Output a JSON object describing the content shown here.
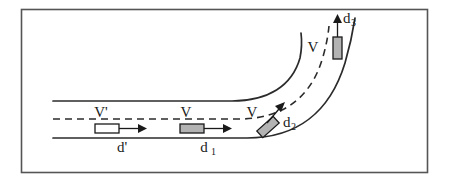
{
  "figure": {
    "frame": {
      "name": "figure-border",
      "color": "#555555",
      "x": 21,
      "y": 9,
      "width": 407,
      "height": 164
    },
    "colors": {
      "line": "#2b2b2b",
      "vehicle_fill_gray": "#b3b3b3",
      "vehicle_fill_white": "#ffffff",
      "vehicle_stroke": "#1a1a1a",
      "frame": "#555555",
      "background": "#ffffff"
    },
    "road": {
      "outer_edge_name": "road-outer-edge",
      "inner_edge_name": "road-inner-edge",
      "centerline_name": "road-centerline-dashed",
      "straight_start_x": 53,
      "inner_edge_y": 101,
      "centerline_y": 119,
      "outer_edge_y": 138
    },
    "labels": {
      "v_prime": "V'",
      "v_second": "V",
      "v_curve_lower": "V",
      "v_curve_upper": "V",
      "d_prime": "d'",
      "d_one_base": "d",
      "d_one_sub": "1",
      "d_two_base": "d",
      "d_two_sub": "2",
      "d_three_base": "d",
      "d_three_sub": "3"
    },
    "vehicles": [
      {
        "name": "vehicle-1-white",
        "fill": "#ffffff",
        "x": 95,
        "y": 124,
        "width": 24,
        "height": 9,
        "rotation": 0,
        "speed_label": "V'",
        "distance_label": "d'"
      },
      {
        "name": "vehicle-2-gray",
        "fill": "#b3b3b3",
        "x": 180,
        "y": 124,
        "width": 24,
        "height": 9,
        "rotation": 0,
        "speed_label": "V",
        "distance_label": "d1"
      },
      {
        "name": "vehicle-3-rotated-gray",
        "fill": "#b3b3b3",
        "x": 258,
        "y": 122,
        "width": 22,
        "height": 9,
        "rotation": -42,
        "speed_label": "V",
        "distance_label": "d2"
      },
      {
        "name": "vehicle-4-vertical-gray",
        "fill": "#b3b3b3",
        "x": 333,
        "y": 36,
        "width": 9,
        "height": 22,
        "rotation": 90,
        "speed_label": "V",
        "distance_label": "d3"
      }
    ],
    "arrows": [
      {
        "name": "arrow-d-prime",
        "direction": "right",
        "from_x": 119,
        "from_y": 128,
        "to_x": 143,
        "to_y": 128
      },
      {
        "name": "arrow-d-one",
        "direction": "right",
        "from_x": 204,
        "from_y": 128,
        "to_x": 228,
        "to_y": 128
      },
      {
        "name": "arrow-d-two",
        "direction": "up-right",
        "from_x": 264,
        "from_y": 126,
        "to_x": 283,
        "to_y": 104
      },
      {
        "name": "arrow-d-three",
        "direction": "up",
        "from_x": 337,
        "from_y": 36,
        "to_x": 337,
        "to_y": 17
      }
    ]
  }
}
